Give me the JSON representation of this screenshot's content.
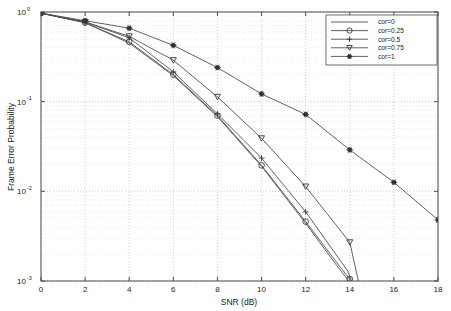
{
  "figure": {
    "background_color": "#ffffff",
    "line_color": "#4f4f4f",
    "grid_color": "#b9b9b9",
    "axis_color": "#4a4a4a"
  },
  "chart_data": {
    "type": "line",
    "title": "",
    "xlabel": "SNR (dB)",
    "ylabel": "Frame Error Probability",
    "xlim": [
      0,
      18
    ],
    "ylim": [
      0.001,
      1
    ],
    "yscale": "log",
    "xscale": "linear",
    "xticks": [
      0,
      2,
      4,
      6,
      8,
      10,
      12,
      14,
      16,
      18
    ],
    "xticklabels": [
      "0",
      "2",
      "4",
      "6",
      "8",
      "10",
      "12",
      "14",
      "16",
      "18"
    ],
    "yticks": [
      1,
      0.1,
      0.01,
      0.001
    ],
    "yticklabels": [
      "10^0",
      "10^-1",
      "10^-2",
      "10^-3"
    ],
    "ytick_mantissa": [
      "10",
      "10",
      "10",
      "10"
    ],
    "ytick_exponent": [
      "0",
      "-1",
      "-2",
      "-3"
    ],
    "grid": true,
    "legend_position": "upper right",
    "series": [
      {
        "name": "cor=0",
        "marker": "none",
        "x": [
          0,
          2,
          4,
          6,
          8,
          10,
          12,
          13.4,
          14
        ],
        "values": [
          0.97,
          0.76,
          0.45,
          0.195,
          0.068,
          0.019,
          0.0044,
          0.0015,
          0.00097
        ]
      },
      {
        "name": "cor=0.25",
        "marker": "circle",
        "x": [
          0,
          2,
          4,
          6,
          8,
          10,
          12,
          13.5,
          14
        ],
        "values": [
          0.97,
          0.76,
          0.465,
          0.2,
          0.07,
          0.0195,
          0.0046,
          0.0015,
          0.00105
        ]
      },
      {
        "name": "cor=0.5",
        "marker": "plus",
        "x": [
          0,
          2,
          4,
          6,
          8,
          10,
          12,
          13.9,
          14.1
        ],
        "values": [
          0.97,
          0.775,
          0.515,
          0.215,
          0.073,
          0.0235,
          0.0059,
          0.0013,
          0.00098
        ]
      },
      {
        "name": "cor=0.75",
        "marker": "triangle-down",
        "x": [
          0,
          2,
          4,
          6,
          8,
          10,
          12,
          14,
          14.4
        ],
        "values": [
          0.97,
          0.775,
          0.535,
          0.29,
          0.113,
          0.039,
          0.0113,
          0.0027,
          0.00098
        ]
      },
      {
        "name": "cor=1",
        "marker": "star",
        "x": [
          0,
          2,
          4,
          6,
          8,
          10,
          12,
          14,
          16,
          18
        ],
        "values": [
          0.97,
          0.8,
          0.66,
          0.425,
          0.24,
          0.122,
          0.072,
          0.029,
          0.0126,
          0.0048
        ]
      }
    ]
  },
  "legend": {
    "entries": [
      {
        "label": "cor=0",
        "marker": "none"
      },
      {
        "label": "cor=0.25",
        "marker": "circle"
      },
      {
        "label": "cor=0.5",
        "marker": "plus"
      },
      {
        "label": "cor=0.75",
        "marker": "triangle-down"
      },
      {
        "label": "cor=1",
        "marker": "star"
      }
    ]
  }
}
